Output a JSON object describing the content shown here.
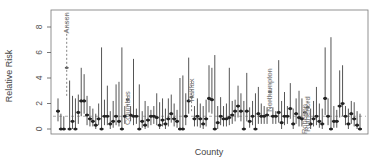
{
  "chart_data": {
    "type": "errorbar",
    "title": "",
    "xlabel": "County",
    "ylabel": "Relative Risk",
    "ylim": [
      -0.3,
      9.2
    ],
    "yticks": [
      0,
      2,
      4,
      6,
      8
    ],
    "reference_line": {
      "y": 1,
      "style": "dashed",
      "color": "#888888"
    },
    "grid": false,
    "legend": null,
    "highlighted_counties": [
      "Anson",
      "Columbus",
      "Halifax",
      "Northampton",
      "Robeson",
      "Rutherford"
    ],
    "series": [
      {
        "county": "",
        "estimate": 1.4,
        "lower": 0.6,
        "upper": 2.4
      },
      {
        "county": "",
        "estimate": 0.0,
        "lower": 0.0,
        "upper": 1.2
      },
      {
        "county": "",
        "estimate": 0.0,
        "lower": 0.0,
        "upper": 1.0
      },
      {
        "county": "Anson",
        "estimate": 4.8,
        "lower": 2.6,
        "upper": 9.0,
        "highlight": true
      },
      {
        "county": "",
        "estimate": 0.0,
        "lower": 0.0,
        "upper": 3.8
      },
      {
        "county": "",
        "estimate": 0.6,
        "lower": 0.0,
        "upper": 2.6
      },
      {
        "county": "",
        "estimate": 0.0,
        "lower": 0.0,
        "upper": 2.4
      },
      {
        "county": "",
        "estimate": 1.3,
        "lower": 0.4,
        "upper": 2.7
      },
      {
        "county": "",
        "estimate": 2.2,
        "lower": 1.0,
        "upper": 4.8
      },
      {
        "county": "",
        "estimate": 2.2,
        "lower": 1.2,
        "upper": 4.3
      },
      {
        "county": "",
        "estimate": 1.1,
        "lower": 0.3,
        "upper": 2.6
      },
      {
        "county": "",
        "estimate": 0.8,
        "lower": 0.2,
        "upper": 1.8
      },
      {
        "county": "",
        "estimate": 0.6,
        "lower": 0.2,
        "upper": 1.6
      },
      {
        "county": "",
        "estimate": 0.3,
        "lower": 0.0,
        "upper": 1.2
      },
      {
        "county": "",
        "estimate": 0.8,
        "lower": 0.3,
        "upper": 2.0
      },
      {
        "county": "",
        "estimate": 0.0,
        "lower": 0.0,
        "upper": 6.4
      },
      {
        "county": "",
        "estimate": 1.0,
        "lower": 0.3,
        "upper": 2.3
      },
      {
        "county": "",
        "estimate": 1.0,
        "lower": 0.3,
        "upper": 3.4
      },
      {
        "county": "",
        "estimate": 0.4,
        "lower": 0.0,
        "upper": 1.4
      },
      {
        "county": "",
        "estimate": 0.6,
        "lower": 0.1,
        "upper": 2.2
      },
      {
        "county": "",
        "estimate": 1.0,
        "lower": 0.3,
        "upper": 3.5
      },
      {
        "county": "",
        "estimate": 0.6,
        "lower": 0.2,
        "upper": 3.7
      },
      {
        "county": "",
        "estimate": 0.0,
        "lower": 0.0,
        "upper": 6.4
      },
      {
        "county": "",
        "estimate": 1.0,
        "lower": 0.4,
        "upper": 1.8
      },
      {
        "county": "Columbus",
        "estimate": 2.3,
        "lower": 1.8,
        "upper": 2.8,
        "highlight": true
      },
      {
        "county": "",
        "estimate": 1.1,
        "lower": 0.6,
        "upper": 1.8
      },
      {
        "county": "",
        "estimate": 1.0,
        "lower": 0.3,
        "upper": 5.5
      },
      {
        "county": "",
        "estimate": 1.0,
        "lower": 0.4,
        "upper": 1.6
      },
      {
        "county": "",
        "estimate": 0.0,
        "lower": 0.0,
        "upper": 3.5
      },
      {
        "county": "",
        "estimate": 0.6,
        "lower": 0.1,
        "upper": 1.4
      },
      {
        "county": "",
        "estimate": 0.3,
        "lower": 0.0,
        "upper": 2.2
      },
      {
        "county": "",
        "estimate": 0.7,
        "lower": 0.1,
        "upper": 1.8
      },
      {
        "county": "",
        "estimate": 1.0,
        "lower": 0.3,
        "upper": 1.5
      },
      {
        "county": "",
        "estimate": 1.0,
        "lower": 0.4,
        "upper": 1.8
      },
      {
        "county": "",
        "estimate": 0.9,
        "lower": 0.3,
        "upper": 2.8
      },
      {
        "county": "",
        "estimate": 0.3,
        "lower": 0.0,
        "upper": 2.1
      },
      {
        "county": "",
        "estimate": 0.7,
        "lower": 0.2,
        "upper": 2.4
      },
      {
        "county": "",
        "estimate": 0.4,
        "lower": 0.0,
        "upper": 1.6
      },
      {
        "county": "",
        "estimate": 0.8,
        "lower": 0.2,
        "upper": 2.4
      },
      {
        "county": "",
        "estimate": 1.2,
        "lower": 0.5,
        "upper": 2.7
      },
      {
        "county": "",
        "estimate": 0.8,
        "lower": 0.2,
        "upper": 2.0
      },
      {
        "county": "",
        "estimate": 0.6,
        "lower": 0.1,
        "upper": 1.5
      },
      {
        "county": "",
        "estimate": 0.0,
        "lower": 0.0,
        "upper": 4.0
      },
      {
        "county": "",
        "estimate": 0.0,
        "lower": 0.0,
        "upper": 4.2
      },
      {
        "county": "",
        "estimate": 1.0,
        "lower": 0.3,
        "upper": 2.8
      },
      {
        "county": "",
        "estimate": 2.2,
        "lower": 1.2,
        "upper": 5.6
      },
      {
        "county": "Halifax",
        "estimate": 2.5,
        "lower": 1.4,
        "upper": 3.8,
        "highlight": true
      },
      {
        "county": "",
        "estimate": 0.8,
        "lower": 0.2,
        "upper": 1.8
      },
      {
        "county": "",
        "estimate": 1.0,
        "lower": 0.2,
        "upper": 2.4
      },
      {
        "county": "",
        "estimate": 0.8,
        "lower": 0.1,
        "upper": 2.0
      },
      {
        "county": "",
        "estimate": 0.4,
        "lower": 0.0,
        "upper": 1.8
      },
      {
        "county": "",
        "estimate": 0.8,
        "lower": 0.2,
        "upper": 2.3
      },
      {
        "county": "",
        "estimate": 2.4,
        "lower": 1.3,
        "upper": 5.0
      },
      {
        "county": "",
        "estimate": 2.3,
        "lower": 1.2,
        "upper": 4.8
      },
      {
        "county": "",
        "estimate": 0.0,
        "lower": 0.0,
        "upper": 5.8
      },
      {
        "county": "",
        "estimate": 0.5,
        "lower": 0.0,
        "upper": 1.8
      },
      {
        "county": "",
        "estimate": 1.0,
        "lower": 0.3,
        "upper": 2.5
      },
      {
        "county": "",
        "estimate": 0.8,
        "lower": 0.2,
        "upper": 1.8
      },
      {
        "county": "",
        "estimate": 0.8,
        "lower": 0.2,
        "upper": 2.0
      },
      {
        "county": "",
        "estimate": 0.9,
        "lower": 0.3,
        "upper": 4.8
      },
      {
        "county": "",
        "estimate": 1.1,
        "lower": 0.4,
        "upper": 2.2
      },
      {
        "county": "",
        "estimate": 1.4,
        "lower": 0.6,
        "upper": 2.3
      },
      {
        "county": "",
        "estimate": 1.8,
        "lower": 0.9,
        "upper": 3.4
      },
      {
        "county": "",
        "estimate": 1.4,
        "lower": 0.6,
        "upper": 2.8
      },
      {
        "county": "",
        "estimate": 0.0,
        "lower": 0.0,
        "upper": 2.2
      },
      {
        "county": "",
        "estimate": 1.4,
        "lower": 0.6,
        "upper": 4.4
      },
      {
        "county": "",
        "estimate": 0.6,
        "lower": 0.1,
        "upper": 1.7
      },
      {
        "county": "",
        "estimate": 1.0,
        "lower": 0.3,
        "upper": 2.2
      },
      {
        "county": "",
        "estimate": 0.0,
        "lower": 0.0,
        "upper": 2.8
      },
      {
        "county": "",
        "estimate": 1.2,
        "lower": 0.4,
        "upper": 3.3
      },
      {
        "county": "",
        "estimate": 1.0,
        "lower": 0.4,
        "upper": 2.0
      },
      {
        "county": "",
        "estimate": 1.0,
        "lower": 0.4,
        "upper": 1.8
      },
      {
        "county": "",
        "estimate": 1.1,
        "lower": 0.4,
        "upper": 1.7
      },
      {
        "county": "Northampton",
        "estimate": 2.9,
        "lower": 1.6,
        "upper": 4.6,
        "highlight": true
      },
      {
        "county": "",
        "estimate": 1.0,
        "lower": 0.4,
        "upper": 1.7
      },
      {
        "county": "",
        "estimate": 1.0,
        "lower": 0.4,
        "upper": 1.4
      },
      {
        "county": "",
        "estimate": 1.3,
        "lower": 0.5,
        "upper": 5.4
      },
      {
        "county": "",
        "estimate": 0.5,
        "lower": 0.0,
        "upper": 2.2
      },
      {
        "county": "",
        "estimate": 1.0,
        "lower": 0.3,
        "upper": 2.9
      },
      {
        "county": "",
        "estimate": 1.0,
        "lower": 0.4,
        "upper": 1.8
      },
      {
        "county": "",
        "estimate": 1.6,
        "lower": 0.8,
        "upper": 3.6
      },
      {
        "county": "",
        "estimate": 0.4,
        "lower": 0.0,
        "upper": 1.6
      },
      {
        "county": "",
        "estimate": 1.2,
        "lower": 0.4,
        "upper": 2.4
      },
      {
        "county": "",
        "estimate": 0.9,
        "lower": 0.2,
        "upper": 3.0
      },
      {
        "county": "",
        "estimate": 0.8,
        "lower": 0.2,
        "upper": 2.4
      },
      {
        "county": "Robeson",
        "estimate": 1.3,
        "lower": 1.0,
        "upper": 1.8,
        "highlight": true
      },
      {
        "county": "Rutherford",
        "estimate": 1.7,
        "lower": 1.1,
        "upper": 2.4,
        "highlight": true
      },
      {
        "county": "",
        "estimate": 0.4,
        "lower": 0.0,
        "upper": 1.6
      },
      {
        "county": "",
        "estimate": 0.8,
        "lower": 0.2,
        "upper": 2.2
      },
      {
        "county": "",
        "estimate": 1.0,
        "lower": 0.3,
        "upper": 3.3
      },
      {
        "county": "",
        "estimate": 0.6,
        "lower": 0.1,
        "upper": 2.0
      },
      {
        "county": "",
        "estimate": 0.4,
        "lower": 0.0,
        "upper": 1.6
      },
      {
        "county": "",
        "estimate": 2.4,
        "lower": 1.1,
        "upper": 6.4
      },
      {
        "county": "",
        "estimate": 1.0,
        "lower": 0.3,
        "upper": 2.4
      },
      {
        "county": "",
        "estimate": 0.0,
        "lower": 0.0,
        "upper": 7.2
      },
      {
        "county": "",
        "estimate": 0.6,
        "lower": 0.1,
        "upper": 1.8
      },
      {
        "county": "",
        "estimate": 0.6,
        "lower": 0.1,
        "upper": 1.5
      },
      {
        "county": "",
        "estimate": 1.8,
        "lower": 0.9,
        "upper": 4.6
      },
      {
        "county": "",
        "estimate": 2.0,
        "lower": 1.0,
        "upper": 5.0
      },
      {
        "county": "",
        "estimate": 1.0,
        "lower": 0.3,
        "upper": 1.8
      },
      {
        "county": "",
        "estimate": 0.4,
        "lower": 0.0,
        "upper": 1.6
      },
      {
        "county": "",
        "estimate": 1.2,
        "lower": 0.4,
        "upper": 2.2
      },
      {
        "county": "",
        "estimate": 0.8,
        "lower": 0.2,
        "upper": 2.1
      },
      {
        "county": "",
        "estimate": 0.3,
        "lower": 0.0,
        "upper": 1.4
      },
      {
        "county": "",
        "estimate": 0.0,
        "lower": 0.0,
        "upper": 1.2
      }
    ],
    "colors": {
      "interval": "#555555",
      "point": "#222222",
      "highlight_line": "#666666",
      "axis": "#555555"
    }
  }
}
